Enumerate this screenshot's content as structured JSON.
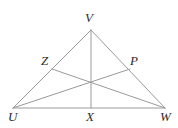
{
  "figure": {
    "type": "geometry-diagram",
    "shape": "triangle",
    "background_color": "#ffffff",
    "line_color": "#9a9a9a",
    "line_width": 1,
    "label_color": "#2b2b2b",
    "points": {
      "U": {
        "label": "U",
        "x": 13,
        "y": 108,
        "label_x": 8,
        "label_y": 110,
        "kind": "vertex"
      },
      "V": {
        "label": "V",
        "x": 91,
        "y": 30,
        "label_x": 85,
        "label_y": 11,
        "kind": "vertex"
      },
      "W": {
        "label": "W",
        "x": 165,
        "y": 108,
        "label_x": 160,
        "label_y": 110,
        "kind": "vertex"
      },
      "X": {
        "label": "X",
        "x": 91,
        "y": 108,
        "label_x": 86,
        "label_y": 110,
        "kind": "midpoint-of-UW"
      },
      "Z": {
        "label": "Z",
        "x": 52,
        "y": 69,
        "label_x": 41,
        "label_y": 54,
        "kind": "midpoint-of-UV"
      },
      "P": {
        "label": "P",
        "x": 130,
        "y": 69,
        "label_x": 130,
        "label_y": 54,
        "kind": "midpoint-of-VW"
      },
      "C": {
        "label": "",
        "x": 91,
        "y": 81,
        "label_x": 0,
        "label_y": 0,
        "kind": "centroid"
      }
    },
    "segments": [
      {
        "name": "side-UV",
        "from": "U",
        "to": "V"
      },
      {
        "name": "side-VW",
        "from": "V",
        "to": "W"
      },
      {
        "name": "side-UW",
        "from": "U",
        "to": "W"
      },
      {
        "name": "median-VX",
        "from": "V",
        "to": "X"
      },
      {
        "name": "median-UP",
        "from": "U",
        "to": "P"
      },
      {
        "name": "median-WZ",
        "from": "W",
        "to": "Z"
      }
    ],
    "label_order": [
      "V",
      "Z",
      "P",
      "U",
      "X",
      "W"
    ]
  }
}
